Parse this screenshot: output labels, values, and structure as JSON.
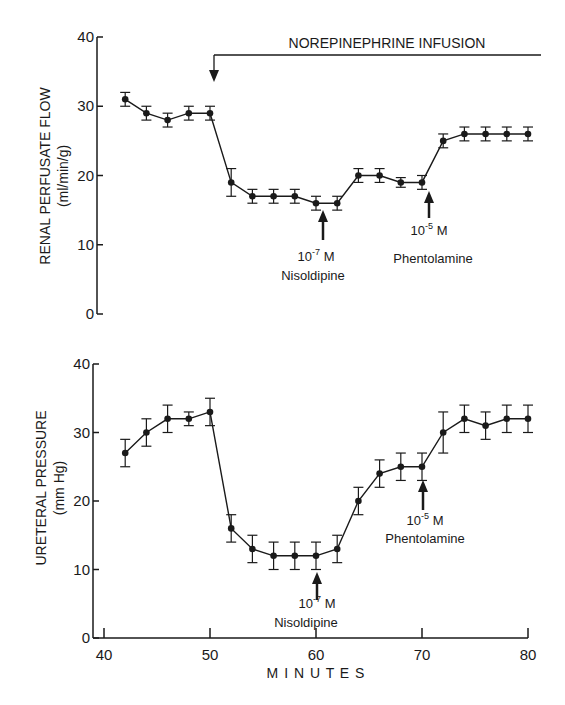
{
  "chart_data": [
    {
      "type": "line",
      "title": "",
      "xlabel": "MINUTES",
      "ylabel": "RENAL PERFUSATE FLOW",
      "ylabel_units": "(ml/min/g)",
      "xlim": [
        40,
        80
      ],
      "ylim": [
        0,
        40
      ],
      "yticks": [
        0,
        10,
        20,
        30,
        40
      ],
      "x": [
        42,
        44,
        46,
        48,
        50,
        52,
        54,
        56,
        58,
        60,
        62,
        64,
        66,
        68,
        70,
        72,
        74,
        76,
        78,
        80
      ],
      "series": [
        {
          "name": "Renal perfusate flow",
          "values": [
            31,
            29,
            28,
            29,
            29,
            19,
            17,
            17,
            17,
            16,
            16,
            20,
            20,
            19,
            19,
            25,
            26,
            26,
            26,
            26
          ],
          "error": [
            1,
            1,
            1,
            1,
            1,
            2,
            1,
            1,
            1,
            1,
            1,
            1,
            1,
            0.7,
            1,
            1,
            1,
            1,
            1,
            1
          ]
        }
      ],
      "annotations": [
        {
          "text": "NOREPINEPHRINE INFUSION",
          "type": "bracket",
          "x_start": 50
        },
        {
          "text_line1": "10",
          "sup": "-7",
          "unit": " M",
          "text_line2": "Nisoldipine",
          "x": 60
        },
        {
          "text_line1": "10",
          "sup": "-5",
          "unit": " M",
          "text_line2": "Phentolamine",
          "x": 70
        }
      ],
      "grid": false
    },
    {
      "type": "line",
      "title": "",
      "xlabel": "MINUTES",
      "ylabel": "URETERAL PRESSURE",
      "ylabel_units": "(mm Hg)",
      "xlim": [
        40,
        80
      ],
      "ylim": [
        0,
        40
      ],
      "xticks": [
        40,
        50,
        60,
        70,
        80
      ],
      "yticks": [
        0,
        10,
        20,
        30,
        40
      ],
      "x": [
        42,
        44,
        46,
        48,
        50,
        52,
        54,
        56,
        58,
        60,
        62,
        64,
        66,
        68,
        70,
        72,
        74,
        76,
        78,
        80
      ],
      "series": [
        {
          "name": "Ureteral pressure",
          "values": [
            27,
            30,
            32,
            32,
            33,
            16,
            13,
            12,
            12,
            12,
            13,
            20,
            24,
            25,
            25,
            30,
            32,
            31,
            32,
            32
          ],
          "error": [
            2,
            2,
            2,
            1,
            2,
            2,
            2,
            2,
            2,
            2,
            2,
            2,
            2,
            2,
            2,
            3,
            2,
            2,
            2,
            2
          ]
        }
      ],
      "annotations": [
        {
          "text_line1": "10",
          "sup": "-7",
          "unit": " M",
          "text_line2": "Nisoldipine",
          "x": 60
        },
        {
          "text_line1": "10",
          "sup": "-5",
          "unit": " M",
          "text_line2": "Phentolamine",
          "x": 70
        }
      ],
      "grid": false
    }
  ],
  "labels": {
    "xlabel": "M I N U T E S",
    "top_ylabel": "RENAL PERFUSATE FLOW",
    "top_yunits": "(ml/min/g)",
    "bot_ylabel": "URETERAL PRESSURE",
    "bot_yunits": "(mm Hg)",
    "infusion": "NOREPINEPHRINE INFUSION",
    "conc_nis_base": "10",
    "conc_nis_sup": "-7",
    "conc_phe_base": "10",
    "conc_phe_sup": "-5",
    "conc_unit": " M",
    "nisoldipine": "Nisoldipine",
    "phentolamine": "Phentolamine",
    "yticks": [
      "0",
      "10",
      "20",
      "30",
      "40"
    ],
    "xticks": [
      "40",
      "50",
      "60",
      "70",
      "80"
    ]
  },
  "colors": {
    "ink": "#1a1a1a",
    "background": "#ffffff"
  }
}
